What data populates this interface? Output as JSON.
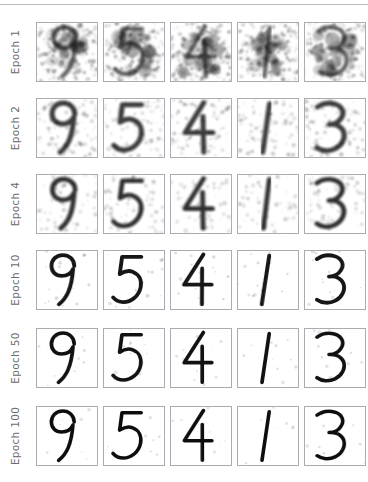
{
  "figure": {
    "title": "",
    "row_label_prefix": "Epoch"
  },
  "rows": [
    {
      "label": "Epoch 1",
      "epoch": 1,
      "quality": "noise",
      "blur": 1.6,
      "noise": 0.95,
      "opacity": 0.62,
      "stroke": 7.5,
      "jitter": 3.2
    },
    {
      "label": "Epoch 2",
      "epoch": 2,
      "quality": "very-blurry",
      "blur": 2.2,
      "noise": 0.55,
      "opacity": 0.8,
      "stroke": 8.5,
      "jitter": 2.2
    },
    {
      "label": "Epoch 4",
      "epoch": 4,
      "quality": "blurry",
      "blur": 2.0,
      "noise": 0.42,
      "opacity": 0.85,
      "stroke": 8.0,
      "jitter": 1.7
    },
    {
      "label": "Epoch 10",
      "epoch": 10,
      "quality": "sharp",
      "blur": 0.5,
      "noise": 0.1,
      "opacity": 0.96,
      "stroke": 6.5,
      "jitter": 0.4
    },
    {
      "label": "Epoch 50",
      "epoch": 50,
      "quality": "sharp",
      "blur": 0.35,
      "noise": 0.07,
      "opacity": 0.98,
      "stroke": 6.2,
      "jitter": 0.25
    },
    {
      "label": "Epoch 100",
      "epoch": 100,
      "quality": "sharpest",
      "blur": 0.25,
      "noise": 0.05,
      "opacity": 1.0,
      "stroke": 6.0,
      "jitter": 0.15
    }
  ],
  "columns": [
    {
      "index": 0,
      "digit": "9"
    },
    {
      "index": 1,
      "digit": "5"
    },
    {
      "index": 2,
      "digit": "4"
    },
    {
      "index": 3,
      "digit": "1"
    },
    {
      "index": 4,
      "digit": "3"
    }
  ],
  "chart_data": {
    "type": "heatmap",
    "title": "",
    "subtitle": "",
    "xlabel": "",
    "ylabel": "",
    "grid": false,
    "legend": "none",
    "row_categories": [
      "Epoch 1",
      "Epoch 2",
      "Epoch 4",
      "Epoch 10",
      "Epoch 50",
      "Epoch 100"
    ],
    "column_categories": [
      "9",
      "5",
      "4",
      "1",
      "3"
    ],
    "cells": [
      [
        "9",
        "5",
        "4",
        "1",
        "3"
      ],
      [
        "9",
        "5",
        "4",
        "1",
        "3"
      ],
      [
        "9",
        "5",
        "4",
        "1",
        "3"
      ],
      [
        "9",
        "5",
        "4",
        "1",
        "3"
      ],
      [
        "9",
        "5",
        "4",
        "1",
        "3"
      ],
      [
        "9",
        "5",
        "4",
        "1",
        "3"
      ]
    ],
    "reconstruction_clarity": [
      0.08,
      0.3,
      0.45,
      0.88,
      0.94,
      0.97
    ],
    "ylim": [
      0,
      1
    ]
  },
  "colors": {
    "ink": "#111111",
    "cell_border": "#a9adb2",
    "label_text": "#6b6b6b",
    "rule": "#b8bcc0",
    "background": "#ffffff"
  },
  "glyph_paths": {
    "9": "M62 26 C62 14,53 7,43 7 C31 7,24 16,24 26 C24 36,31 43,41 43 C50 43,57 38,60 31 C60 31,58 56,52 70 C48 80,42 87,36 92",
    "5": "M62 10 L30 10 L26 40 C33 35,41 33,48 36 C58 40,63 50,61 62 C58 78,45 88,32 88 C25 88,19 85,15 80",
    "4": "M54 6 L22 58 L68 58 M52 30 L52 92",
    "1": "M52 8 L40 92",
    "3": "M20 14 C28 8,40 6,50 9 C62 13,66 24,60 33 C56 40,48 44,40 44 C50 43,60 47,64 56 C68 67,62 80,50 86 C40 91,28 90,20 84"
  }
}
